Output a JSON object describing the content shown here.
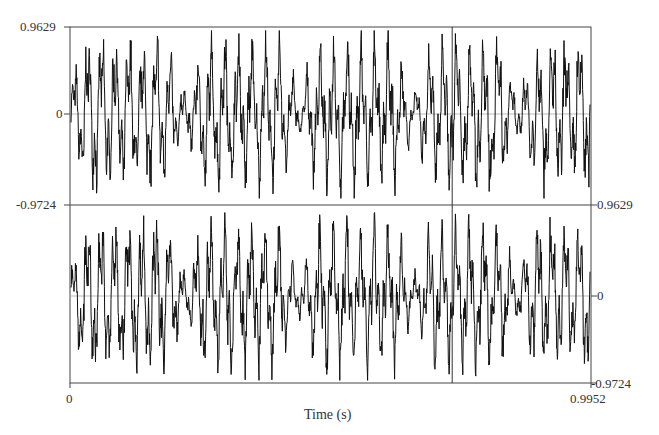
{
  "chart_data": {
    "type": "line",
    "title": "",
    "xlabel": "Time (s)",
    "ylabel": "",
    "xlim": [
      0,
      0.9952
    ],
    "channels": [
      {
        "name": "channel-1",
        "ylim": [
          -0.9724,
          0.9629
        ],
        "y_ticks": [
          "0.9629",
          "0",
          "-0.9724"
        ],
        "tick_side": "left"
      },
      {
        "name": "channel-2",
        "ylim": [
          -0.9724,
          0.9629
        ],
        "y_ticks": [
          "0.9629",
          "0",
          "-0.9724"
        ],
        "tick_side": "right"
      }
    ],
    "x_ticks": [
      "0",
      "0.9952"
    ],
    "cursor_time": 0.73,
    "grid": false,
    "legend": null,
    "series_summary": "Stereo speech-like waveform, 5 bursts of high-amplitude oscillation separated by low-amplitude noisy segments near t≈0.21, 0.43, 0.65, 0.85 s"
  },
  "labels": {
    "top_max": "0.9629",
    "top_zero": "0",
    "top_min": "-0.9724",
    "bottom_max": "0.9629",
    "bottom_zero": "0",
    "bottom_min": "-0.9724",
    "x_start": "0",
    "x_end": "0.9952",
    "x_axis_title": "Time (s)"
  }
}
